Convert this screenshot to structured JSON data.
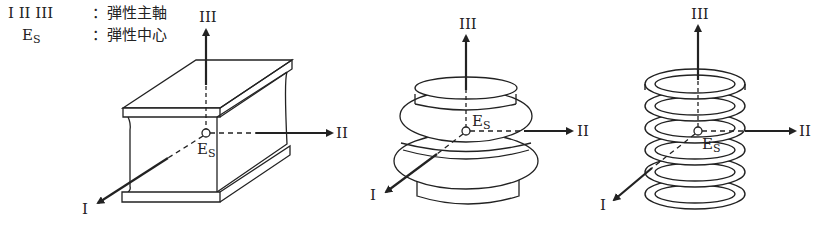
{
  "legend": [
    {
      "symbol": "I II III",
      "separator": "：",
      "meaning": "弾性主軸"
    },
    {
      "symbol": "E",
      "symbol_sub": "S",
      "separator": "：",
      "meaning": "弾性中心"
    }
  ],
  "figures": [
    {
      "name": "rubber-block",
      "axes": {
        "I": "I",
        "II": "II",
        "III": "III"
      },
      "center": "E",
      "center_sub": "S"
    },
    {
      "name": "air-bellows",
      "axes": {
        "I": "I",
        "II": "II",
        "III": "III"
      },
      "center": "E",
      "center_sub": "S"
    },
    {
      "name": "coil-spring",
      "axes": {
        "I": "I",
        "II": "II",
        "III": "III"
      },
      "center": "E",
      "center_sub": "S"
    }
  ]
}
